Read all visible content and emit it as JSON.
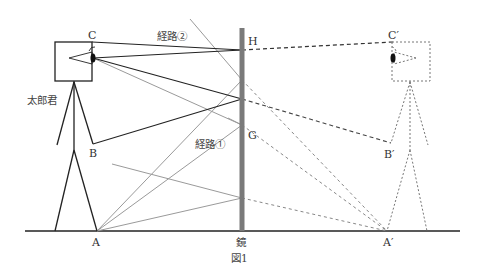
{
  "figure": {
    "caption": "図1",
    "mirror_label": "鏡",
    "person_label": "太郎君",
    "path_labels": {
      "path1": "経路①",
      "path2": "経路②"
    },
    "point_labels": {
      "A": "A",
      "B": "B",
      "C": "C",
      "G": "G",
      "H": "H",
      "A_prime": "A′",
      "B_prime": "B′",
      "C_prime": "C′"
    }
  },
  "colors": {
    "ink": "#222222",
    "gray_ray": "#9a9a9a",
    "mirror": "#7a7a7a",
    "reflection": "#777777"
  },
  "geometry": {
    "ground_y": 231,
    "mirror_x": 242,
    "mirror_top_y": 28,
    "points": {
      "A": [
        97,
        231
      ],
      "B": [
        93,
        144
      ],
      "C": [
        92,
        42
      ],
      "eye": [
        93,
        58
      ],
      "H": [
        242,
        50
      ],
      "G": [
        242,
        125
      ],
      "A_prime": [
        387,
        231
      ],
      "B_prime": [
        391,
        143
      ],
      "C_prime": [
        393,
        42
      ]
    }
  }
}
